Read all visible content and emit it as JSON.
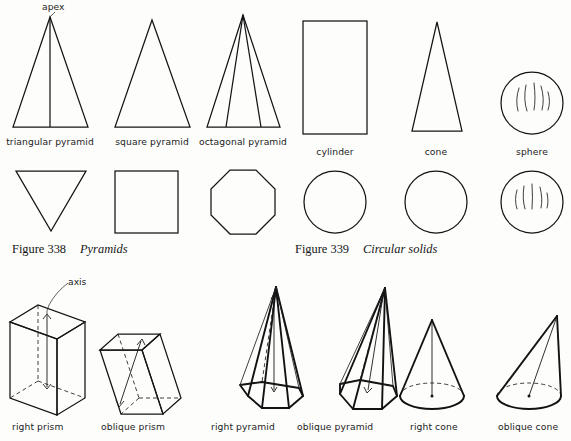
{
  "plate": {
    "width": 571,
    "height": 441,
    "background": "#fdfdfc",
    "ink": "#141414"
  },
  "annotations": {
    "apex": "apex",
    "axis": "axis"
  },
  "figure_338": {
    "number": "Figure 338",
    "title": "Pyramids",
    "items": [
      {
        "label": "triangular pyramid",
        "elevation": "triangle-with-center-edge",
        "plan": "inverted-triangle"
      },
      {
        "label": "square pyramid",
        "elevation": "plain-triangle",
        "plan": "square"
      },
      {
        "label": "octagonal pyramid",
        "elevation": "triangle-with-two-edges",
        "plan": "octagon"
      }
    ]
  },
  "figure_339": {
    "number": "Figure 339",
    "title": "Circular solids",
    "items": [
      {
        "label": "cylinder",
        "elevation": "rectangle",
        "plan": "circle"
      },
      {
        "label": "cone",
        "elevation": "triangle",
        "plan": "circle"
      },
      {
        "label": "sphere",
        "elevation": "shaded-circle",
        "plan": "shaded-circle"
      }
    ]
  },
  "figure_bottom": {
    "items": [
      {
        "label": "right prism",
        "kind": "prism",
        "orientation": "right",
        "has_axis_label": true
      },
      {
        "label": "oblique prism",
        "kind": "prism",
        "orientation": "oblique",
        "has_axis_label": false
      },
      {
        "label": "right pyramid",
        "kind": "octagonal-pyramid",
        "orientation": "right",
        "has_axis_label": false
      },
      {
        "label": "oblique pyramid",
        "kind": "octagonal-pyramid",
        "orientation": "oblique",
        "has_axis_label": false
      },
      {
        "label": "right cone",
        "kind": "cone",
        "orientation": "right",
        "has_axis_label": false
      },
      {
        "label": "oblique cone",
        "kind": "cone",
        "orientation": "oblique",
        "has_axis_label": false
      }
    ]
  }
}
